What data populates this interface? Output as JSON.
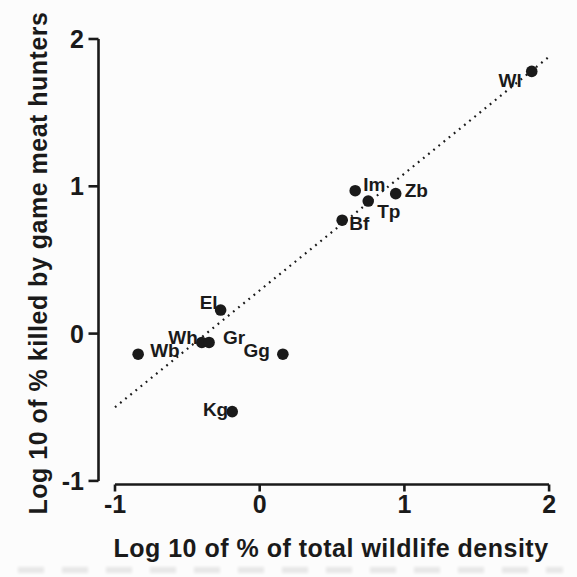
{
  "figure": {
    "background": "#fcfcfc",
    "ink": "#1a1a1a"
  },
  "chart_data": {
    "type": "scatter",
    "title": "",
    "xlabel": "Log 10 of % of total wildlife density",
    "ylabel": "Log 10 of % killed by game meat hunters",
    "xlim": [
      -1,
      2
    ],
    "ylim": [
      -1,
      2
    ],
    "xticks": [
      {
        "value": -1,
        "label": "-1"
      },
      {
        "value": 0,
        "label": "0"
      },
      {
        "value": 1,
        "label": "1"
      },
      {
        "value": 2,
        "label": "2"
      }
    ],
    "yticks": [
      {
        "value": -1,
        "label": "-1"
      },
      {
        "value": 0,
        "label": "0"
      },
      {
        "value": 1,
        "label": "1"
      },
      {
        "value": 2,
        "label": "2"
      }
    ],
    "grid": false,
    "legend": "none",
    "marker": {
      "shape": "filled-circle",
      "color": "#1a1a1a",
      "radius_px": 5.8
    },
    "points": [
      {
        "label": "Wl",
        "x": 1.88,
        "y": 1.78,
        "label_anchor": "end",
        "label_dx": -10,
        "label_dy": 16
      },
      {
        "label": "Im",
        "x": 0.66,
        "y": 0.97,
        "label_anchor": "start",
        "label_dx": 8,
        "label_dy": 0
      },
      {
        "label": "Zb",
        "x": 0.94,
        "y": 0.95,
        "label_anchor": "start",
        "label_dx": 9,
        "label_dy": 3
      },
      {
        "label": "Tp",
        "x": 0.75,
        "y": 0.9,
        "label_anchor": "start",
        "label_dx": 9,
        "label_dy": 17
      },
      {
        "label": "Bf",
        "x": 0.57,
        "y": 0.77,
        "label_anchor": "start",
        "label_dx": 7,
        "label_dy": 10
      },
      {
        "label": "El",
        "x": -0.27,
        "y": 0.16,
        "label_anchor": "end",
        "label_dx": -3,
        "label_dy": -1
      },
      {
        "label": "Wh",
        "x": -0.4,
        "y": -0.06,
        "label_anchor": "end",
        "label_dx": -4,
        "label_dy": 2
      },
      {
        "label": "Gr",
        "x": -0.35,
        "y": -0.06,
        "label_anchor": "start",
        "label_dx": 14,
        "label_dy": 2
      },
      {
        "label": "Wb",
        "x": -0.84,
        "y": -0.14,
        "label_anchor": "start",
        "label_dx": 12,
        "label_dy": 3
      },
      {
        "label": "Gg",
        "x": 0.16,
        "y": -0.14,
        "label_anchor": "end",
        "label_dx": -13,
        "label_dy": 3
      },
      {
        "label": "Kg",
        "x": -0.19,
        "y": -0.53,
        "label_anchor": "end",
        "label_dx": -4,
        "label_dy": 4
      }
    ],
    "trend_line": {
      "style": "dotted",
      "from": {
        "x": -1.0,
        "y": -0.5
      },
      "to": {
        "x": 2.0,
        "y": 1.88
      }
    }
  }
}
